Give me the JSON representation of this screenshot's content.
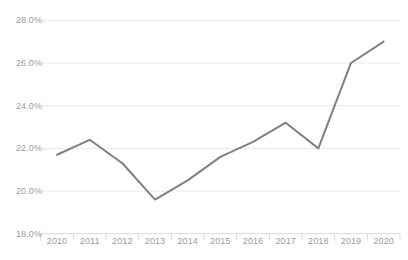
{
  "chart_data": {
    "type": "line",
    "title": "",
    "subtitle": "",
    "xlabel": "",
    "ylabel": "",
    "categories": [
      "2010",
      "2011",
      "2012",
      "2013",
      "2014",
      "2015",
      "2016",
      "2017",
      "2018",
      "2019",
      "2020"
    ],
    "values": [
      21.7,
      22.4,
      21.3,
      19.6,
      20.5,
      21.6,
      22.3,
      23.2,
      22.0,
      26.0,
      27.0
    ],
    "series": [
      {
        "name": "",
        "values": [
          21.7,
          22.4,
          21.3,
          19.6,
          20.5,
          21.6,
          22.3,
          23.2,
          22.0,
          26.0,
          27.0
        ]
      }
    ],
    "ylim": [
      18.0,
      28.0
    ],
    "ytick_values": [
      28.0,
      26.0,
      24.0,
      22.0,
      20.0,
      18.0
    ],
    "ytick_labels": [
      "28.0%",
      "26.0%",
      "24.0%",
      "22.0%",
      "20.0%",
      "18.0%"
    ],
    "xtick_labels": [
      "2010",
      "2011",
      "2012",
      "2013",
      "2014",
      "2015",
      "2016",
      "2017",
      "2018",
      "2019",
      "2020"
    ],
    "grid": "horizontal",
    "legend": "none",
    "annotations": [],
    "colors": {
      "line": "#808080",
      "gridline": "#e8e8e8",
      "axis": "#d9d9d9",
      "tick_text": "#9b9b9b",
      "background": "#ffffff"
    }
  }
}
